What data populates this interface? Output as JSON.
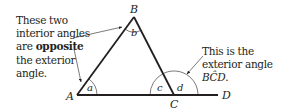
{
  "diagram": {
    "vertices": {
      "A": "A",
      "B": "B",
      "C": "C",
      "D": "D"
    },
    "angles": {
      "a": "a",
      "b": "b",
      "c": "c",
      "d": "d"
    },
    "left_note": {
      "line1": "These two",
      "line2": "interior angles",
      "line3_prefix": "are ",
      "line3_bold": "opposite",
      "line4": "the exterior",
      "line5": "angle."
    },
    "right_note": {
      "line1": "This is the",
      "line2_prefix": "exterior angle ",
      "line2_angle": "BĈD",
      "line2_suffix": "."
    },
    "colors": {
      "line": "#231f20",
      "text": "#231f20",
      "background": "#ffffff"
    }
  }
}
